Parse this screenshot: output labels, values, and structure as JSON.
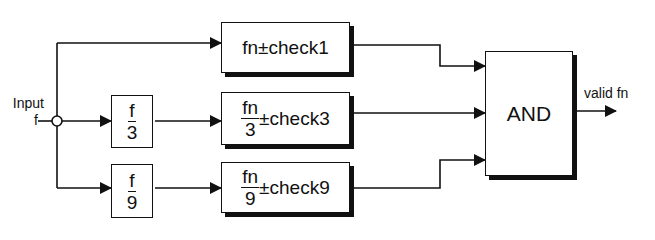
{
  "input": {
    "label_line1": "Input",
    "label_line2": "f"
  },
  "dividers": [
    {
      "numerator": "f",
      "denominator": "3"
    },
    {
      "numerator": "f",
      "denominator": "9"
    }
  ],
  "checks": [
    {
      "prefix": "fn",
      "suffix": "±check1"
    },
    {
      "numerator": "fn",
      "denominator": "3",
      "suffix": "±check3"
    },
    {
      "numerator": "fn",
      "denominator": "9",
      "suffix": "±check9"
    }
  ],
  "and_gate": {
    "label": "AND"
  },
  "output": {
    "label": "valid fn"
  }
}
